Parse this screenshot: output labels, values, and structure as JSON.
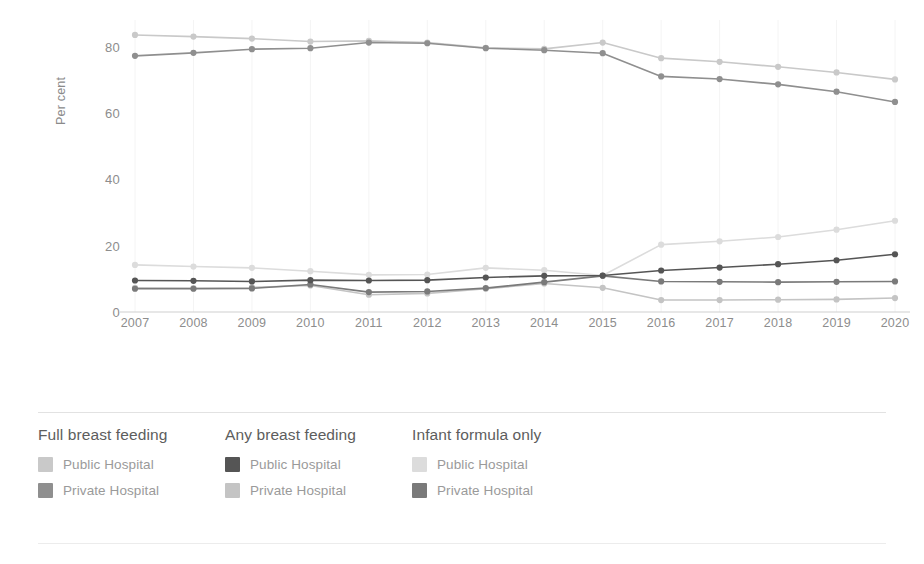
{
  "axes": {
    "ylabel": "Per cent",
    "yticks": [
      0,
      20,
      40,
      60,
      80
    ],
    "ytick_labels": [
      "0",
      "20",
      "40",
      "60",
      "80"
    ],
    "xtick_labels": [
      "2007",
      "2008",
      "2009",
      "2010",
      "2011",
      "2012",
      "2013",
      "2014",
      "2015",
      "2016",
      "2017",
      "2018",
      "2019",
      "2020"
    ]
  },
  "colors": {
    "full_public": "#c9c9c9",
    "full_private": "#8f8f8f",
    "any_public": "#555555",
    "any_private": "#c4c4c4",
    "formula_public": "#dcdcdc",
    "formula_private": "#7a7a7a",
    "axis_line": "#cfcfcf",
    "grid": "#f4f4f4",
    "tick_text": "#8d8d8d",
    "legend_title": "#5d5d5d",
    "legend_label": "#9a9a9a"
  },
  "legend": {
    "groups": [
      {
        "title": "Full breast feeding",
        "items": [
          {
            "label": "Public Hospital",
            "color": "#c9c9c9"
          },
          {
            "label": "Private Hospital",
            "color": "#8f8f8f"
          }
        ]
      },
      {
        "title": "Any breast feeding",
        "items": [
          {
            "label": "Public Hospital",
            "color": "#555555"
          },
          {
            "label": "Private Hospital",
            "color": "#c4c4c4"
          }
        ]
      },
      {
        "title": "Infant formula only",
        "items": [
          {
            "label": "Public Hospital",
            "color": "#dcdcdc"
          },
          {
            "label": "Private Hospital",
            "color": "#7a7a7a"
          }
        ]
      }
    ]
  },
  "chart_data": {
    "type": "line",
    "title": "",
    "xlabel": "",
    "ylabel": "Per cent",
    "x": [
      2007,
      2008,
      2009,
      2010,
      2011,
      2012,
      2013,
      2014,
      2015,
      2016,
      2017,
      2018,
      2019,
      2020
    ],
    "categories": [
      "2007",
      "2008",
      "2009",
      "2010",
      "2011",
      "2012",
      "2013",
      "2014",
      "2015",
      "2016",
      "2017",
      "2018",
      "2019",
      "2020"
    ],
    "ylim": [
      0,
      88
    ],
    "xlim": [
      2007,
      2020
    ],
    "grid": "faint-vertical",
    "legend_position": "bottom",
    "series": [
      {
        "name": "Full breast feeding - Public Hospital",
        "group": "Full breast feeding",
        "sector": "Public Hospital",
        "color": "#c9c9c9",
        "values": [
          83.5,
          83.0,
          82.4,
          81.5,
          81.7,
          81.2,
          79.6,
          79.3,
          81.2,
          76.5,
          75.4,
          73.9,
          72.2,
          70.1
        ]
      },
      {
        "name": "Full breast feeding - Private Hospital",
        "group": "Full breast feeding",
        "sector": "Private Hospital",
        "color": "#8f8f8f",
        "values": [
          77.2,
          78.1,
          79.2,
          79.5,
          81.2,
          81.0,
          79.5,
          78.9,
          78.0,
          71.0,
          70.2,
          68.6,
          66.4,
          63.3
        ]
      },
      {
        "name": "Any breast feeding - Public Hospital",
        "group": "Any breast feeding",
        "sector": "Public Hospital",
        "color": "#555555",
        "values": [
          9.5,
          9.4,
          9.2,
          9.6,
          9.5,
          9.6,
          10.4,
          10.9,
          11.0,
          12.5,
          13.4,
          14.4,
          15.6,
          17.4
        ]
      },
      {
        "name": "Any breast feeding - Private Hospital",
        "group": "Any breast feeding",
        "sector": "Private Hospital",
        "color": "#c4c4c4",
        "values": [
          7.3,
          7.2,
          7.4,
          8.0,
          5.2,
          5.6,
          7.0,
          8.6,
          7.3,
          3.6,
          3.6,
          3.7,
          3.8,
          4.2
        ]
      },
      {
        "name": "Infant formula only - Public Hospital",
        "group": "Infant formula only",
        "sector": "Public Hospital",
        "color": "#dcdcdc",
        "values": [
          14.2,
          13.7,
          13.3,
          12.3,
          11.2,
          11.3,
          13.3,
          12.6,
          11.0,
          20.3,
          21.3,
          22.6,
          24.8,
          27.5
        ]
      },
      {
        "name": "Infant formula only - Private Hospital",
        "group": "Infant formula only",
        "sector": "Private Hospital",
        "color": "#7a7a7a",
        "values": [
          7.0,
          7.0,
          7.1,
          8.3,
          6.0,
          6.2,
          7.2,
          9.0,
          10.9,
          9.2,
          9.1,
          9.0,
          9.1,
          9.2
        ]
      }
    ]
  }
}
